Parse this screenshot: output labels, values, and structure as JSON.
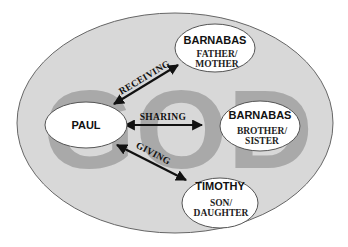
{
  "diagram": {
    "background_label": "GOD",
    "colors": {
      "outer_fill": "#d8d8d8",
      "outer_stroke": "#666666",
      "god_text": "#a9a9a9",
      "node_fill": "#ffffff",
      "node_stroke": "#555555",
      "arrow": "#111111"
    },
    "nodes": [
      {
        "id": "paul",
        "title": "PAUL",
        "subtitle_lines": []
      },
      {
        "id": "barnabas-parent",
        "title": "BARNABAS",
        "subtitle_lines": [
          "FATHER/",
          "MOTHER"
        ]
      },
      {
        "id": "barnabas-sibling",
        "title": "BARNABAS",
        "subtitle_lines": [
          "BROTHER/",
          "SISTER"
        ]
      },
      {
        "id": "timothy",
        "title": "TIMOTHY",
        "subtitle_lines": [
          "SON/",
          "DAUGHTER"
        ]
      }
    ],
    "edges": [
      {
        "from": "paul",
        "to": "barnabas-parent",
        "label": "RECEIVING"
      },
      {
        "from": "paul",
        "to": "barnabas-sibling",
        "label": "SHARING"
      },
      {
        "from": "paul",
        "to": "timothy",
        "label": "GIVING"
      }
    ]
  }
}
